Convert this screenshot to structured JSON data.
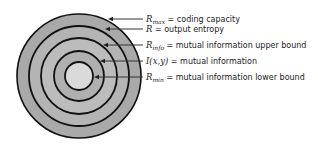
{
  "diagram": {
    "center": [
      79,
      76
    ],
    "rings": [
      {
        "radius": 62,
        "fill": "#a9a9a9"
      },
      {
        "radius": 50,
        "fill": "#b4b4b4"
      },
      {
        "radius": 38,
        "fill": "#bcbcbc"
      },
      {
        "radius": 25,
        "fill": "#b0b0b0"
      },
      {
        "radius": 14,
        "fill": "#dadada"
      }
    ],
    "stroke": "#111111",
    "labels": [
      {
        "symbol": "R",
        "subscript": "max",
        "text": " = coding capacity",
        "y": 19,
        "arrow_tip_x": 108
      },
      {
        "symbol": "R",
        "subscript": "",
        "text": " = output entropy",
        "y": 29,
        "arrow_tip_x": 105
      },
      {
        "symbol": "R",
        "subscript": "info",
        "text": " = mutual information upper bound",
        "y": 45,
        "arrow_tip_x": 103
      },
      {
        "symbol": "I(x,y)",
        "subscript": "",
        "text": " = mutual information",
        "y": 61,
        "arrow_tip_x": 100
      },
      {
        "symbol": "R",
        "subscript": "min",
        "text": " = mutual information lower bound",
        "y": 77,
        "arrow_tip_x": 94
      }
    ]
  }
}
